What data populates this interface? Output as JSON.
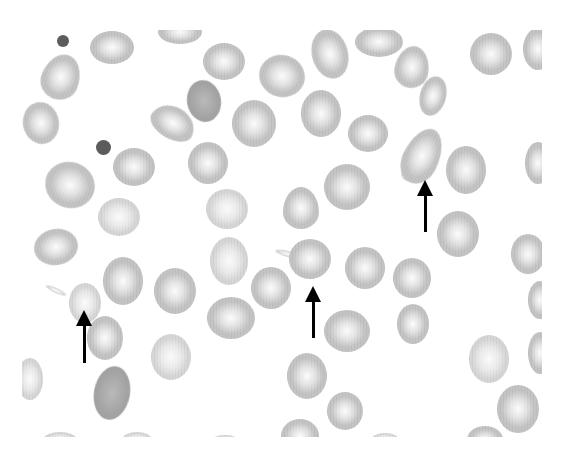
{
  "image": {
    "description": "Grayscale peripheral blood smear showing red blood cells with teardrop-shaped cells (dacrocytes) indicated by arrows",
    "background": "#ffffff",
    "cell_color": "#c4c4c4",
    "dark_cell_color": "#a2a2a2",
    "arrow_color": "#000000"
  },
  "cells": [
    {
      "x": 112,
      "y": 47,
      "w": 44,
      "h": 33,
      "r": 0,
      "kind": "normal"
    },
    {
      "x": 180,
      "y": 32,
      "w": 44,
      "h": 24,
      "r": 0,
      "kind": "normal"
    },
    {
      "x": 224,
      "y": 61,
      "w": 42,
      "h": 37,
      "r": 0,
      "kind": "normal"
    },
    {
      "x": 282,
      "y": 76,
      "w": 46,
      "h": 42,
      "r": 15,
      "kind": "normal"
    },
    {
      "x": 330,
      "y": 54,
      "w": 36,
      "h": 50,
      "r": -15,
      "kind": "normal"
    },
    {
      "x": 379,
      "y": 42,
      "w": 48,
      "h": 30,
      "r": 0,
      "kind": "normal"
    },
    {
      "x": 412,
      "y": 67,
      "w": 34,
      "h": 42,
      "r": 10,
      "kind": "tear"
    },
    {
      "x": 491,
      "y": 54,
      "w": 42,
      "h": 42,
      "r": 0,
      "kind": "normal"
    },
    {
      "x": 538,
      "y": 49,
      "w": 30,
      "h": 42,
      "r": 0,
      "kind": "normal"
    },
    {
      "x": 61,
      "y": 77,
      "w": 38,
      "h": 46,
      "r": 20,
      "kind": "tear"
    },
    {
      "x": 204,
      "y": 101,
      "w": 34,
      "h": 42,
      "r": -10,
      "kind": "dark"
    },
    {
      "x": 173,
      "y": 123,
      "w": 46,
      "h": 32,
      "r": 30,
      "kind": "tear"
    },
    {
      "x": 254,
      "y": 123,
      "w": 44,
      "h": 47,
      "r": 0,
      "kind": "normal"
    },
    {
      "x": 321,
      "y": 113,
      "w": 40,
      "h": 47,
      "r": 0,
      "kind": "normal"
    },
    {
      "x": 368,
      "y": 133,
      "w": 40,
      "h": 37,
      "r": 0,
      "kind": "normal"
    },
    {
      "x": 433,
      "y": 96,
      "w": 26,
      "h": 40,
      "r": 15,
      "kind": "normal"
    },
    {
      "x": 41,
      "y": 123,
      "w": 36,
      "h": 42,
      "r": -10,
      "kind": "normal"
    },
    {
      "x": 134,
      "y": 167,
      "w": 42,
      "h": 38,
      "r": 0,
      "kind": "normal"
    },
    {
      "x": 208,
      "y": 163,
      "w": 40,
      "h": 42,
      "r": 0,
      "kind": "normal"
    },
    {
      "x": 422,
      "y": 156,
      "w": 36,
      "h": 58,
      "r": 25,
      "kind": "tear"
    },
    {
      "x": 466,
      "y": 170,
      "w": 40,
      "h": 48,
      "r": 0,
      "kind": "normal"
    },
    {
      "x": 538,
      "y": 163,
      "w": 26,
      "h": 42,
      "r": 0,
      "kind": "normal"
    },
    {
      "x": 70,
      "y": 185,
      "w": 50,
      "h": 46,
      "r": 20,
      "kind": "normal"
    },
    {
      "x": 347,
      "y": 187,
      "w": 46,
      "h": 46,
      "r": 0,
      "kind": "normal"
    },
    {
      "x": 301,
      "y": 208,
      "w": 36,
      "h": 42,
      "r": 0,
      "kind": "tear"
    },
    {
      "x": 119,
      "y": 217,
      "w": 42,
      "h": 38,
      "r": 0,
      "kind": "light"
    },
    {
      "x": 227,
      "y": 209,
      "w": 42,
      "h": 40,
      "r": 0,
      "kind": "light"
    },
    {
      "x": 458,
      "y": 234,
      "w": 42,
      "h": 46,
      "r": 0,
      "kind": "normal"
    },
    {
      "x": 56,
      "y": 247,
      "w": 44,
      "h": 36,
      "r": -10,
      "kind": "normal"
    },
    {
      "x": 229,
      "y": 261,
      "w": 38,
      "h": 48,
      "r": 0,
      "kind": "light"
    },
    {
      "x": 310,
      "y": 259,
      "w": 42,
      "h": 40,
      "r": 0,
      "kind": "normal"
    },
    {
      "x": 365,
      "y": 268,
      "w": 40,
      "h": 42,
      "r": 0,
      "kind": "normal"
    },
    {
      "x": 412,
      "y": 278,
      "w": 38,
      "h": 40,
      "r": 0,
      "kind": "normal"
    },
    {
      "x": 528,
      "y": 254,
      "w": 34,
      "h": 40,
      "r": 0,
      "kind": "normal"
    },
    {
      "x": 85,
      "y": 303,
      "w": 32,
      "h": 40,
      "r": 0,
      "kind": "light"
    },
    {
      "x": 123,
      "y": 281,
      "w": 40,
      "h": 48,
      "r": 0,
      "kind": "normal"
    },
    {
      "x": 175,
      "y": 291,
      "w": 42,
      "h": 46,
      "r": 0,
      "kind": "normal"
    },
    {
      "x": 271,
      "y": 288,
      "w": 40,
      "h": 42,
      "r": 0,
      "kind": "normal"
    },
    {
      "x": 231,
      "y": 318,
      "w": 48,
      "h": 42,
      "r": 0,
      "kind": "normal"
    },
    {
      "x": 347,
      "y": 331,
      "w": 46,
      "h": 42,
      "r": 0,
      "kind": "normal"
    },
    {
      "x": 413,
      "y": 324,
      "w": 32,
      "h": 40,
      "r": 0,
      "kind": "normal"
    },
    {
      "x": 540,
      "y": 300,
      "w": 24,
      "h": 38,
      "r": 0,
      "kind": "normal"
    },
    {
      "x": 105,
      "y": 338,
      "w": 36,
      "h": 44,
      "r": 0,
      "kind": "normal"
    },
    {
      "x": 171,
      "y": 357,
      "w": 40,
      "h": 46,
      "r": 0,
      "kind": "light"
    },
    {
      "x": 489,
      "y": 359,
      "w": 40,
      "h": 48,
      "r": 0,
      "kind": "light"
    },
    {
      "x": 540,
      "y": 353,
      "w": 24,
      "h": 42,
      "r": 0,
      "kind": "normal"
    },
    {
      "x": 30,
      "y": 379,
      "w": 26,
      "h": 42,
      "r": 0,
      "kind": "light"
    },
    {
      "x": 112,
      "y": 393,
      "w": 36,
      "h": 54,
      "r": 10,
      "kind": "dark"
    },
    {
      "x": 307,
      "y": 376,
      "w": 40,
      "h": 46,
      "r": 0,
      "kind": "normal"
    },
    {
      "x": 345,
      "y": 411,
      "w": 36,
      "h": 38,
      "r": 0,
      "kind": "normal"
    },
    {
      "x": 518,
      "y": 409,
      "w": 42,
      "h": 48,
      "r": 0,
      "kind": "normal"
    },
    {
      "x": 300,
      "y": 436,
      "w": 38,
      "h": 34,
      "r": 0,
      "kind": "normal"
    },
    {
      "x": 60,
      "y": 440,
      "w": 34,
      "h": 16,
      "r": 0,
      "kind": "light"
    },
    {
      "x": 137,
      "y": 440,
      "w": 30,
      "h": 16,
      "r": 0,
      "kind": "light"
    },
    {
      "x": 225,
      "y": 440,
      "w": 26,
      "h": 10,
      "r": 0,
      "kind": "light"
    },
    {
      "x": 385,
      "y": 440,
      "w": 28,
      "h": 14,
      "r": 0,
      "kind": "light"
    },
    {
      "x": 485,
      "y": 440,
      "w": 36,
      "h": 28,
      "r": 0,
      "kind": "normal"
    }
  ],
  "tails": [
    {
      "x": 288,
      "y": 254,
      "w": 26,
      "h": 6,
      "r": 15
    },
    {
      "x": 56,
      "y": 290,
      "w": 22,
      "h": 5,
      "r": 25
    },
    {
      "x": 408,
      "y": 175,
      "w": 12,
      "h": 14,
      "r": -60
    }
  ],
  "platelets": [
    {
      "x": 63,
      "y": 41,
      "d": 12
    },
    {
      "x": 103,
      "y": 147,
      "d": 15
    }
  ],
  "arrows": [
    {
      "label": "teardrop-cell-arrow-left",
      "tip_x": 84,
      "tip_y": 310,
      "tail_y": 363
    },
    {
      "label": "teardrop-cell-arrow-center",
      "tip_x": 313,
      "tip_y": 286,
      "tail_y": 338
    },
    {
      "label": "teardrop-cell-arrow-right",
      "tip_x": 425,
      "tip_y": 180,
      "tail_y": 232
    }
  ]
}
